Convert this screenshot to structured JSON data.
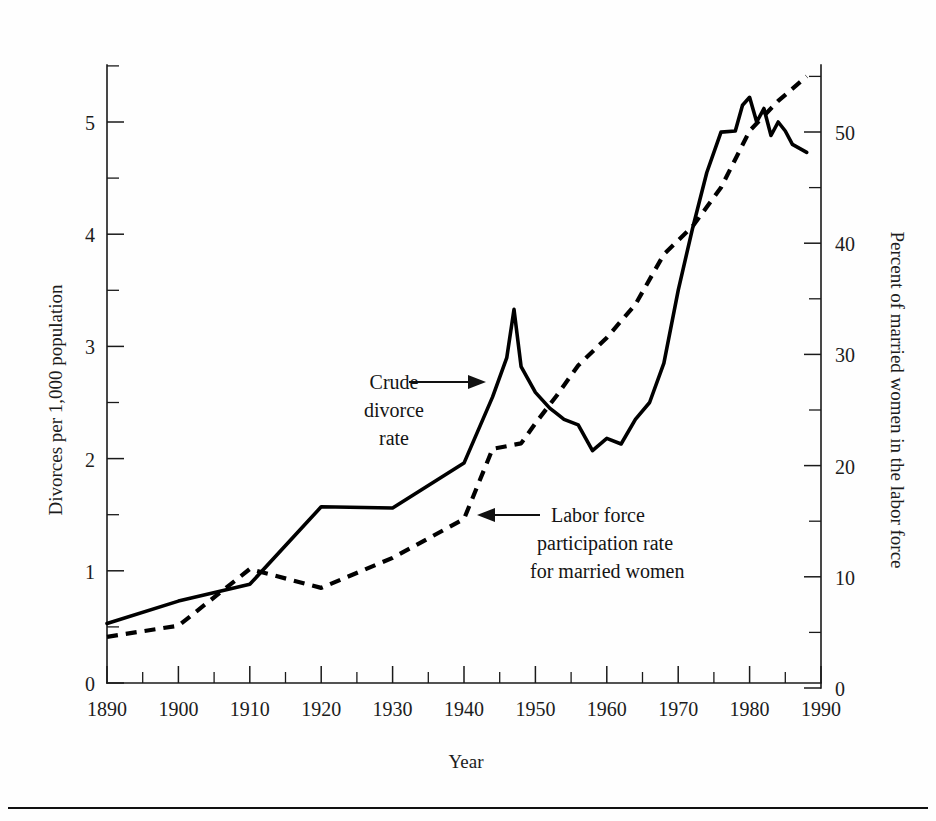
{
  "figure": {
    "background": "#fefefe",
    "ink_color": "#000000",
    "rule_color": "#111111"
  },
  "chart_data": {
    "type": "line",
    "title": "",
    "xlabel": "Year",
    "grid": false,
    "legend_position": "inline-annotations",
    "xlim": [
      1890,
      1990
    ],
    "x_ticks_major": [
      1890,
      1900,
      1910,
      1920,
      1930,
      1940,
      1950,
      1960,
      1970,
      1980,
      1990
    ],
    "x_tick_labels": [
      "1890",
      "1900",
      "1910",
      "1920",
      "1930",
      "1940",
      "1950",
      "1960",
      "1970",
      "1980",
      "1990"
    ],
    "x_ticks_minor": [
      1895,
      1905,
      1915,
      1925,
      1935,
      1945,
      1955,
      1965,
      1975,
      1985
    ],
    "left_axis": {
      "label": "Divorces per 1,000 population",
      "ylim": [
        0,
        5.5
      ],
      "ticks_major": [
        0,
        1,
        2,
        3,
        4,
        5
      ],
      "tick_labels": [
        "0",
        "1",
        "2",
        "3",
        "4",
        "5"
      ],
      "ticks_minor": [
        0.5,
        1.5,
        2.5,
        3.5,
        4.5,
        5.5
      ]
    },
    "right_axis": {
      "label": "Percent of married women in the labor force",
      "ylim": [
        0,
        55
      ],
      "ticks_major": [
        0,
        10,
        20,
        30,
        40,
        50
      ],
      "tick_labels": [
        "0",
        "10",
        "20",
        "30",
        "40",
        "50"
      ],
      "ticks_minor": [
        5,
        15,
        25,
        35,
        45,
        55
      ]
    },
    "series": [
      {
        "name": "Crude divorce rate",
        "axis": "left",
        "style": "solid",
        "x": [
          1890,
          1900,
          1910,
          1920,
          1930,
          1940,
          1944,
          1946,
          1947,
          1948,
          1950,
          1952,
          1953,
          1954,
          1956,
          1958,
          1960,
          1962,
          1964,
          1966,
          1968,
          1970,
          1972,
          1974,
          1976,
          1978,
          1979,
          1980,
          1981,
          1982,
          1983,
          1984,
          1985,
          1986,
          1988
        ],
        "values": [
          0.53,
          0.73,
          0.88,
          1.57,
          1.56,
          1.96,
          2.55,
          2.9,
          3.33,
          2.82,
          2.59,
          2.45,
          2.4,
          2.35,
          2.3,
          2.07,
          2.18,
          2.13,
          2.35,
          2.5,
          2.85,
          3.5,
          4.05,
          4.55,
          4.91,
          4.92,
          5.15,
          5.22,
          5.0,
          5.12,
          4.88,
          5.0,
          4.92,
          4.8,
          4.73
        ]
      },
      {
        "name": "Labor force participation rate for married women",
        "axis": "right",
        "style": "dashed",
        "x": [
          1890,
          1900,
          1910,
          1920,
          1930,
          1940,
          1944,
          1948,
          1950,
          1953,
          1956,
          1960,
          1964,
          1968,
          1972,
          1976,
          1980,
          1984,
          1988
        ],
        "values": [
          4.6,
          5.6,
          10.7,
          9.0,
          11.7,
          15.2,
          21.5,
          22.0,
          23.8,
          26.3,
          29.0,
          31.5,
          34.5,
          39.0,
          41.5,
          45.0,
          50.1,
          52.8,
          55.0
        ]
      }
    ],
    "annotations": [
      {
        "text_lines": [
          "Crude",
          "divorce",
          "rate"
        ],
        "arrow_direction": "right",
        "points_to_series": "Crude divorce rate"
      },
      {
        "text_lines": [
          "Labor force",
          "participation rate",
          "for married women"
        ],
        "arrow_direction": "left",
        "points_to_series": "Labor force participation rate for married women"
      }
    ]
  }
}
